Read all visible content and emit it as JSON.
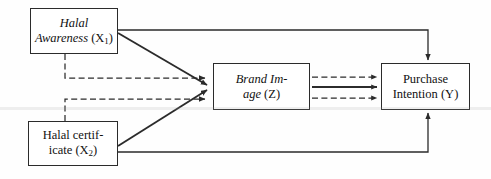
{
  "diagram": {
    "type": "path-model",
    "title": "",
    "background_color": "#fefefe",
    "line_color": "#2b2b2b",
    "nodes": [
      {
        "id": "halal-awareness",
        "name_part": "Halal Awareness",
        "code": "X",
        "subscript": "1",
        "open_paren": "(",
        "close_paren": ")",
        "style": "italic-name",
        "line1": "Halal",
        "line2": "Awareness"
      },
      {
        "id": "brand-image",
        "name_part": "Brand Image",
        "code": "Z",
        "subscript": "",
        "open_paren": "(",
        "close_paren": ")",
        "style": "italic-name",
        "line1": "Brand Im-",
        "line2": "age"
      },
      {
        "id": "purchase-intention",
        "name_part": "Purchase Intention",
        "code": "Y",
        "subscript": "",
        "open_paren": "(",
        "close_paren": ")",
        "style": "upright",
        "line1": "Purchase",
        "line2": "Intention"
      },
      {
        "id": "halal-certificate",
        "name_part": "Halal certificate",
        "code": "X",
        "subscript": "2",
        "open_paren": "(",
        "close_paren": ")",
        "style": "upright",
        "line1": "Halal certif-",
        "line2": "icate"
      }
    ],
    "edges": [
      {
        "id": "x1-to-y",
        "from": "halal-awareness",
        "to": "purchase-intention",
        "style": "solid"
      },
      {
        "id": "x2-to-y",
        "from": "halal-certificate",
        "to": "purchase-intention",
        "style": "solid"
      },
      {
        "id": "x1-to-z",
        "from": "halal-awareness",
        "to": "brand-image",
        "style": "solid"
      },
      {
        "id": "x2-to-z",
        "from": "halal-certificate",
        "to": "brand-image",
        "style": "solid"
      },
      {
        "id": "x1-to-z-indirect",
        "from": "halal-awareness",
        "to": "brand-image",
        "style": "dashed"
      },
      {
        "id": "x2-to-z-indirect",
        "from": "halal-certificate",
        "to": "brand-image",
        "style": "dashed"
      },
      {
        "id": "z-to-y-upper",
        "from": "brand-image",
        "to": "purchase-intention",
        "style": "dashed"
      },
      {
        "id": "z-to-y-middle",
        "from": "brand-image",
        "to": "purchase-intention",
        "style": "solid"
      },
      {
        "id": "z-to-y-lower",
        "from": "brand-image",
        "to": "purchase-intention",
        "style": "dashed"
      }
    ]
  }
}
